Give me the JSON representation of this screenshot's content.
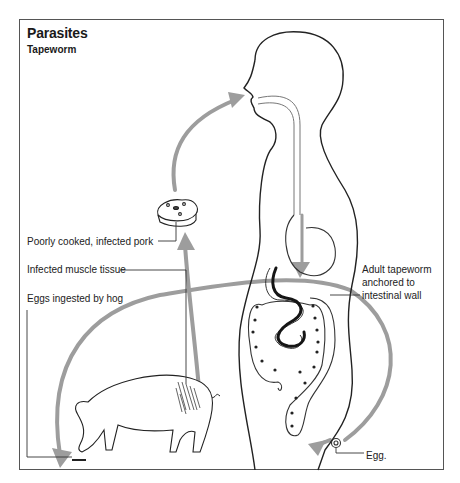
{
  "figure": {
    "title": "Parasites",
    "subtitle": "Tapeworm",
    "labels": {
      "pork": "Poorly cooked, infected pork",
      "muscle": "Infected muscle tissue",
      "eggs_ingested": "Eggs ingested by hog",
      "adult": "Adult tapeworm anchored to intestinal wall",
      "egg": "Egg."
    },
    "colors": {
      "line": "#222222",
      "arrow": "#9a9a9a",
      "frame": "#555555",
      "worm": "#1a1a1a"
    },
    "elements": [
      "human-figure",
      "pork-steak",
      "hog",
      "cycle-arrows",
      "intestines",
      "tapeworm",
      "egg"
    ]
  }
}
